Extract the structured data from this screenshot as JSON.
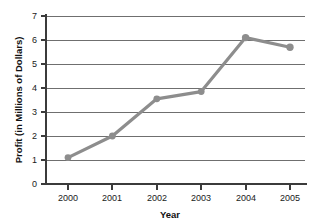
{
  "chart_data": {
    "type": "line",
    "title": "",
    "xlabel": "Year",
    "ylabel": "Profit (in Millions of Dollars)",
    "categories": [
      "2000",
      "2001",
      "2002",
      "2003",
      "2004",
      "2005"
    ],
    "x": [
      2000,
      2001,
      2002,
      2003,
      2004,
      2005
    ],
    "values": [
      1.1,
      2.0,
      3.55,
      3.85,
      6.1,
      5.7
    ],
    "series": [
      {
        "name": "Profit",
        "values": [
          1.1,
          2.0,
          3.55,
          3.85,
          6.1,
          5.7
        ]
      }
    ],
    "ylim": [
      0,
      7
    ],
    "yticks": [
      0,
      1,
      2,
      3,
      4,
      5,
      6,
      7
    ],
    "ytick_labels": [
      "0",
      "1",
      "2",
      "3",
      "4",
      "5",
      "6",
      "7"
    ],
    "xtick_labels": [
      "2000",
      "2001",
      "2002",
      "2003",
      "2004",
      "2005"
    ],
    "grid": "horizontal",
    "legend": "none",
    "marker": "circle",
    "line_color": "#8d8d8d",
    "marker_color": "#8d8d8d",
    "grid_color": "#6f6f6f",
    "axis_color": "#3b3b3b",
    "text_color": "#1a1a1a",
    "background": "#ffffff",
    "annotations": []
  },
  "ticks": {
    "y": [
      {
        "label": "7",
        "value": 7
      },
      {
        "label": "6",
        "value": 6
      },
      {
        "label": "5",
        "value": 5
      },
      {
        "label": "4",
        "value": 4
      },
      {
        "label": "3",
        "value": 3
      },
      {
        "label": "2",
        "value": 2
      },
      {
        "label": "1",
        "value": 1
      },
      {
        "label": "0",
        "value": 0
      }
    ],
    "x": [
      {
        "label": "2000"
      },
      {
        "label": "2001"
      },
      {
        "label": "2002"
      },
      {
        "label": "2003"
      },
      {
        "label": "2004"
      },
      {
        "label": "2005"
      }
    ]
  }
}
